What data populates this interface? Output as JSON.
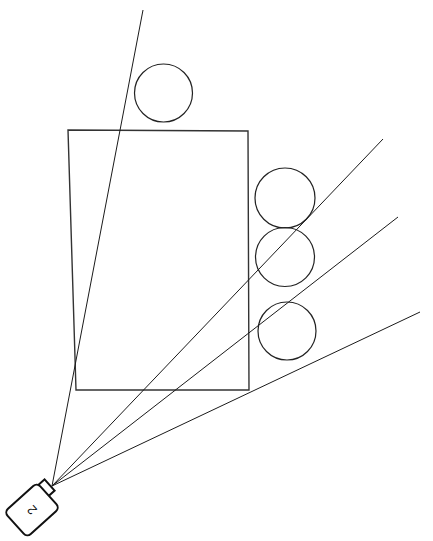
{
  "scene": {
    "title": "Sensor Ray Casting Diagram",
    "width": 433,
    "height": 541,
    "background_color": "#ffffff"
  },
  "sensor": {
    "label": "2",
    "label_rotation_deg": -90,
    "body_rotation_deg": -42,
    "body_center": {
      "x": 32,
      "y": 510
    },
    "body_width": 44,
    "body_height": 34,
    "body_corner_radius": 5,
    "stroke_color": "#111111",
    "fill_color": "#ffffff",
    "connector": {
      "name": "sensor-connector",
      "center": {
        "x": 44,
        "y": 490
      },
      "size": 15,
      "rotation_deg": -42
    },
    "origin": {
      "x": 52,
      "y": 486
    }
  },
  "rays": [
    {
      "id": "ray-1",
      "start": {
        "x": 52,
        "y": 486
      },
      "end": {
        "x": 143,
        "y": 10
      },
      "color": "#1a1a1a"
    },
    {
      "id": "ray-2",
      "start": {
        "x": 52,
        "y": 486
      },
      "end": {
        "x": 383,
        "y": 139
      },
      "color": "#1a1a1a"
    },
    {
      "id": "ray-3",
      "start": {
        "x": 52,
        "y": 486
      },
      "end": {
        "x": 398,
        "y": 217
      },
      "color": "#1a1a1a"
    },
    {
      "id": "ray-4",
      "start": {
        "x": 52,
        "y": 486
      },
      "end": {
        "x": 420,
        "y": 312
      },
      "color": "#1a1a1a"
    }
  ],
  "obstacles": {
    "rectangles": [
      {
        "id": "rect-1",
        "points": "68,130 248,131 249,390 76,390",
        "stroke_color": "#333333"
      }
    ],
    "circles": [
      {
        "id": "circle-top",
        "cx": 163.5,
        "cy": 93,
        "r": 29.0,
        "stroke_color": "#222222"
      },
      {
        "id": "circle-right-1",
        "cx": 285.0,
        "cy": 198,
        "r": 30.0,
        "stroke_color": "#222222"
      },
      {
        "id": "circle-right-2",
        "cx": 285.0,
        "cy": 257,
        "r": 29.5,
        "stroke_color": "#222222"
      },
      {
        "id": "circle-right-3",
        "cx": 287.0,
        "cy": 331,
        "r": 29.0,
        "stroke_color": "#222222"
      }
    ]
  }
}
